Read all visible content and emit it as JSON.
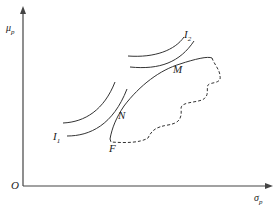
{
  "diagram": {
    "title": "",
    "axes": {
      "y_label": "μ",
      "y_label_sub": "p",
      "x_label": "σ",
      "x_label_sub": "p",
      "origin": "O"
    },
    "points": {
      "M": "M",
      "N": "N",
      "F": "F"
    },
    "curves": {
      "I1": "I",
      "I1_sub": "1",
      "I2": "I",
      "I2_sub": "2"
    }
  }
}
